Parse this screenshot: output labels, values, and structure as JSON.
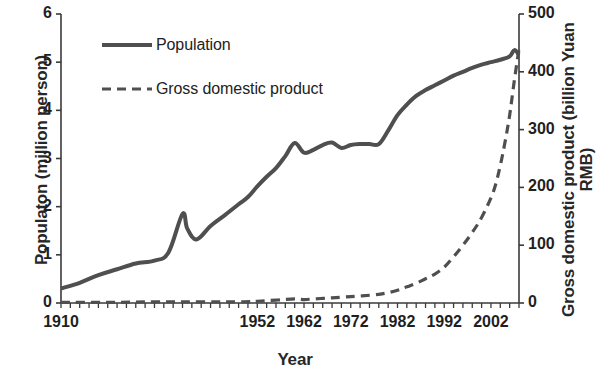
{
  "chart_data": {
    "type": "line",
    "title": "",
    "xlabel": "Year",
    "ylabel": "Populaton (million person)",
    "ylabel_right": "Gross domestic product (billion Yuan RMB)",
    "grid": false,
    "legend_position": "top-left",
    "xlim": [
      1910,
      2008
    ],
    "ylim": [
      0,
      6
    ],
    "ylim_right": [
      0,
      500
    ],
    "xticks": [
      1910,
      1952,
      1962,
      1972,
      1982,
      1992,
      2002
    ],
    "xtick_labels": [
      "1910",
      "1952",
      "1962",
      "1972",
      "1982",
      "1992",
      "2002"
    ],
    "xminor_tick_interval": 2,
    "yticks_left": [
      0,
      1,
      2,
      3,
      4,
      5,
      6
    ],
    "ytick_labels_left": [
      "0",
      "1",
      "2",
      "3",
      "4",
      "5",
      "6"
    ],
    "yticks_right": [
      0,
      100,
      200,
      300,
      400,
      500
    ],
    "ytick_labels_right": [
      "0",
      "100",
      "200",
      "300",
      "400",
      "500"
    ],
    "series": [
      {
        "name": "Population",
        "axis": "left",
        "style": "solid",
        "color": "#4f4f4f",
        "units": "million person",
        "x": [
          1910,
          1914,
          1918,
          1922,
          1926,
          1930,
          1933,
          1936,
          1937,
          1939,
          1942,
          1945,
          1948,
          1950,
          1952,
          1954,
          1956,
          1958,
          1960,
          1962,
          1964,
          1966,
          1968,
          1970,
          1972,
          1974,
          1976,
          1978,
          1980,
          1982,
          1984,
          1986,
          1988,
          1990,
          1992,
          1994,
          1996,
          1998,
          2000,
          2002,
          2004,
          2006,
          2007,
          2008
        ],
        "y": [
          0.3,
          0.42,
          0.58,
          0.7,
          0.82,
          0.88,
          1.05,
          1.85,
          1.55,
          1.32,
          1.6,
          1.82,
          2.05,
          2.2,
          2.42,
          2.62,
          2.8,
          3.05,
          3.32,
          3.12,
          3.18,
          3.28,
          3.33,
          3.22,
          3.28,
          3.3,
          3.3,
          3.3,
          3.58,
          3.9,
          4.12,
          4.3,
          4.42,
          4.52,
          4.62,
          4.72,
          4.8,
          4.88,
          4.95,
          5.0,
          5.05,
          5.12,
          5.25,
          5.15
        ]
      },
      {
        "name": "Gross domestic product",
        "axis": "right",
        "style": "dashed",
        "color": "#4f4f4f",
        "units": "billion Yuan RMB",
        "x": [
          1910,
          1920,
          1930,
          1940,
          1949,
          1952,
          1956,
          1960,
          1962,
          1966,
          1970,
          1974,
          1978,
          1980,
          1982,
          1984,
          1986,
          1988,
          1990,
          1992,
          1994,
          1996,
          1998,
          2000,
          2002,
          2003,
          2004,
          2005,
          2006,
          2007,
          2008
        ],
        "y": [
          1,
          1,
          2,
          2,
          2,
          3,
          5,
          7,
          6,
          8,
          10,
          12,
          15,
          18,
          22,
          28,
          34,
          42,
          50,
          62,
          80,
          100,
          122,
          148,
          182,
          205,
          238,
          278,
          325,
          385,
          440
        ]
      }
    ]
  },
  "legend": {
    "items": [
      {
        "label": "Population",
        "style": "solid"
      },
      {
        "label": "Gross domestic product",
        "style": "dashed"
      }
    ]
  }
}
